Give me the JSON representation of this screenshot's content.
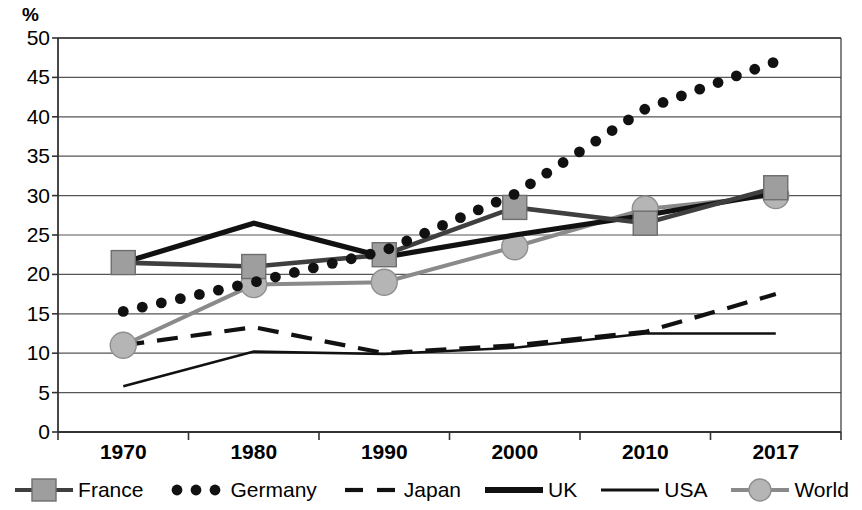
{
  "chart_data": {
    "type": "line",
    "title": "",
    "subtitle": "",
    "xlabel": "",
    "ylabel": "%",
    "categories": [
      "1970",
      "1980",
      "1990",
      "2000",
      "2010",
      "2017"
    ],
    "ylim": [
      0,
      50
    ],
    "ytick_step": 5,
    "yticks": [
      "50",
      "45",
      "40",
      "35",
      "30",
      "25",
      "20",
      "15",
      "10",
      "5",
      "0"
    ],
    "grid": true,
    "legend_position": "bottom",
    "series": [
      {
        "name": "France",
        "style": "line-marker-square",
        "color": "#3f3f3f",
        "marker_fill": "#9e9e9e",
        "values": [
          21.5,
          21.0,
          22.5,
          28.5,
          26.5,
          31.0
        ]
      },
      {
        "name": "Germany",
        "style": "dotted",
        "color": "#111111",
        "values": [
          15.3,
          19.0,
          23.0,
          30.2,
          41.0,
          47.0
        ]
      },
      {
        "name": "Japan",
        "style": "dashed",
        "color": "#111111",
        "values": [
          11.0,
          13.3,
          10.0,
          11.0,
          12.7,
          17.5
        ]
      },
      {
        "name": "UK",
        "style": "thick-line",
        "color": "#111111",
        "values": [
          21.5,
          26.5,
          22.2,
          25.0,
          27.5,
          30.3
        ]
      },
      {
        "name": "USA",
        "style": "thin-line",
        "color": "#111111",
        "values": [
          5.8,
          10.2,
          9.9,
          10.7,
          12.5,
          12.5
        ]
      },
      {
        "name": "World",
        "style": "line-marker-circle",
        "color": "#8a8a8a",
        "marker_fill": "#b5b5b5",
        "values": [
          11.0,
          18.7,
          19.0,
          23.5,
          28.3,
          30.0
        ]
      }
    ],
    "annotations": []
  },
  "legend": {
    "items": [
      {
        "label": "France",
        "key": "square-marker-key"
      },
      {
        "label": "Germany",
        "key": "dotted-key"
      },
      {
        "label": "Japan",
        "key": "dashed-key"
      },
      {
        "label": "UK",
        "key": "thick-line-key"
      },
      {
        "label": "USA",
        "key": "thin-line-key"
      },
      {
        "label": "World",
        "key": "circle-marker-key"
      }
    ]
  },
  "axes": {
    "y_unit_label": "%"
  }
}
